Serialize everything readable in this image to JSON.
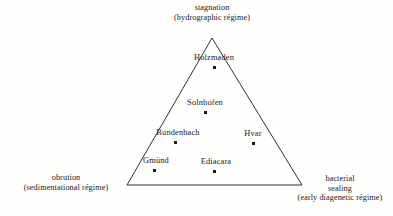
{
  "chart_data": {
    "type": "scatter",
    "title": "",
    "subtitle": "",
    "xlabel": "",
    "ylabel": "",
    "plot_shape": "ternary-triangle",
    "grid": false,
    "legend": "none",
    "axes": [
      {
        "position": "top",
        "name": "stagnation",
        "lines": [
          "stagnation",
          "(hydrographic régime)"
        ]
      },
      {
        "position": "bottom-left",
        "name": "obrution",
        "lines": [
          "obrution",
          "(sedimentational régime)"
        ]
      },
      {
        "position": "bottom-right",
        "name": "bacterial sealing",
        "lines": [
          "bacterial",
          "sealing",
          "(early diagenetic régime)"
        ]
      }
    ],
    "vertices": {
      "top": [
        212,
        38
      ],
      "bottom_left": [
        127,
        185
      ],
      "bottom_right": [
        302,
        185
      ]
    },
    "points": [
      {
        "label": "Holzmaden",
        "x": 214,
        "y": 67,
        "label_x": 214,
        "label_y": 58
      },
      {
        "label": "Solnhofen",
        "x": 205,
        "y": 112,
        "label_x": 205,
        "label_y": 103
      },
      {
        "label": "Bundenbach",
        "x": 175,
        "y": 142,
        "label_x": 178,
        "label_y": 133
      },
      {
        "label": "Hvar",
        "x": 253,
        "y": 143,
        "label_x": 253,
        "label_y": 134
      },
      {
        "label": "Gmünd",
        "x": 154,
        "y": 170,
        "label_x": 156,
        "label_y": 161
      },
      {
        "label": "Ediacara",
        "x": 214,
        "y": 171,
        "label_x": 216,
        "label_y": 162
      }
    ],
    "colors": {
      "background": "#fefefd",
      "line": "#1a1a1a",
      "text": "#1a1a1a",
      "marker": "#1a1a1a"
    }
  }
}
